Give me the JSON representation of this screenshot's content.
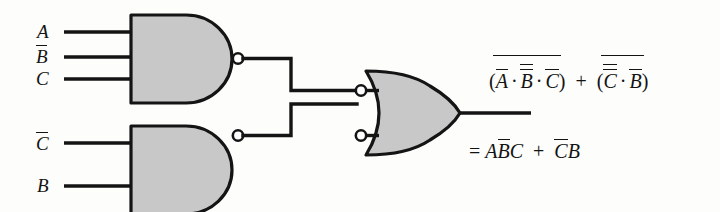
{
  "figure": {
    "background_color": "#fdfdfb",
    "line_color": "#141414",
    "gate_fill_color": "#c8c8c8"
  },
  "inputs": [
    {
      "id": "in-a",
      "label": "A",
      "overbar": false,
      "gate": "nand-1",
      "pin": 1
    },
    {
      "id": "in-b-not",
      "label": "B",
      "overbar": true,
      "gate": "nand-1",
      "pin": 2
    },
    {
      "id": "in-c",
      "label": "C",
      "overbar": false,
      "gate": "nand-1",
      "pin": 3
    },
    {
      "id": "in-c-not",
      "label": "C",
      "overbar": true,
      "gate": "nand-2",
      "pin": 1
    },
    {
      "id": "in-b",
      "label": "B",
      "overbar": false,
      "gate": "nand-2",
      "pin": 2
    }
  ],
  "gates": [
    {
      "id": "nand-1",
      "type": "NAND",
      "inputs": 3,
      "inverted_output": true,
      "name": "upper-nand-gate"
    },
    {
      "id": "nand-2",
      "type": "NAND",
      "inputs": 2,
      "inverted_output": true,
      "name": "lower-nand-gate"
    },
    {
      "id": "or-1",
      "type": "OR",
      "inputs": 2,
      "inverted_inputs": true,
      "name": "output-or-gate"
    }
  ],
  "equations": {
    "line1": {
      "term1": {
        "group_overbar": true,
        "open_paren": "(",
        "close_paren": ")",
        "factors": [
          {
            "text": "A",
            "bars": 1
          },
          {
            "text": "B",
            "bars": 2
          },
          {
            "text": "C",
            "bars": 1
          }
        ],
        "operator": "·"
      },
      "plus": "+",
      "term2": {
        "group_overbar": true,
        "open_paren": "(",
        "close_paren": ")",
        "factors": [
          {
            "text": "C",
            "bars": 2
          },
          {
            "text": "B",
            "bars": 1
          }
        ],
        "operator": "·"
      },
      "plain_text": "(A · B̄ · C) + (C̄ · B)   [group bars]"
    },
    "line2": {
      "equals": "=",
      "terms": [
        {
          "letters": [
            {
              "text": "A",
              "bar": false
            },
            {
              "text": "B",
              "bar": true
            },
            {
              "text": "C",
              "bar": false
            }
          ]
        },
        {
          "letters": [
            {
              "text": "C",
              "bar": true
            },
            {
              "text": "B",
              "bar": false
            }
          ]
        }
      ],
      "plus": "+",
      "plain_text": "= AB̄C + C̄B"
    }
  },
  "labels": {
    "a": "A",
    "b": "B",
    "c": "C",
    "dot": "·",
    "plus": "+",
    "equals": "=",
    "open_paren": "(",
    "close_paren": ")"
  }
}
